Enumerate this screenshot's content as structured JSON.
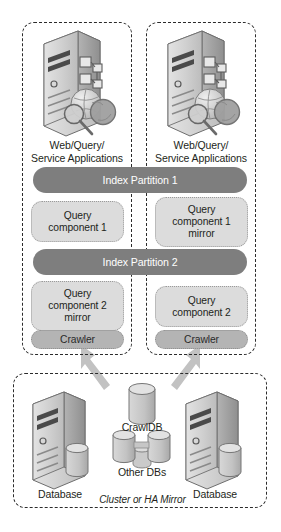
{
  "diagram": {
    "colors": {
      "partition_fill": "#7e7e7e",
      "query_component_fill": "#dcdcdc",
      "crawler_fill": "#b4b4b4",
      "dashed_border": "#2b2b2b",
      "arrow_fill": "#bfbfbf",
      "server_body": "#c9c9c9",
      "text": "#231f20"
    },
    "top_zones": [
      {
        "id": "left-query-server",
        "server_icon": "server-search-icon",
        "label_line1": "Web/Query/",
        "label_line2": "Service Applications",
        "components": [
          {
            "id": "query-component-1",
            "label": "Query\ncomponent 1",
            "type": "query"
          },
          {
            "id": "query-component-2-mirror",
            "label": "Query\ncomponent 2\nmirror",
            "type": "query"
          },
          {
            "id": "crawler-left",
            "label": "Crawler",
            "type": "crawler"
          }
        ]
      },
      {
        "id": "right-query-server",
        "server_icon": "server-search-icon",
        "label_line1": "Web/Query/",
        "label_line2": "Service Applications",
        "components": [
          {
            "id": "query-component-1-mirror",
            "label": "Query\ncomponent 1\nmirror",
            "type": "query"
          },
          {
            "id": "query-component-2",
            "label": "Query\ncomponent 2",
            "type": "query"
          },
          {
            "id": "crawler-right",
            "label": "Crawler",
            "type": "crawler"
          }
        ]
      }
    ],
    "partitions": [
      {
        "id": "index-partition-1",
        "label": "Index Partition 1"
      },
      {
        "id": "index-partition-2",
        "label": "Index Partition 2"
      }
    ],
    "query_components": {
      "top_left": "Query\ncomponent 1",
      "top_left_l1": "Query",
      "top_left_l2": "component 1",
      "top_right_l1": "Query",
      "top_right_l2": "component 1",
      "top_right_l3": "mirror",
      "bottom_left_l1": "Query",
      "bottom_left_l2": "component 2",
      "bottom_left_l3": "mirror",
      "bottom_right_l1": "Query",
      "bottom_right_l2": "component 2"
    },
    "crawler_label": "Crawler",
    "database_zone": {
      "id": "database-cluster",
      "caption": "Cluster or HA Mirror",
      "left_server_label": "Database",
      "right_server_label": "Database",
      "crawldb_label": "CrawlDB",
      "other_dbs_label": "Other DBs"
    },
    "arrows": [
      {
        "id": "crawldb-to-left-crawler",
        "from": "CrawlDB",
        "to": "Crawler (left)"
      },
      {
        "id": "crawldb-to-right-crawler",
        "from": "CrawlDB",
        "to": "Crawler (right)"
      }
    ],
    "figure_caption": ""
  }
}
